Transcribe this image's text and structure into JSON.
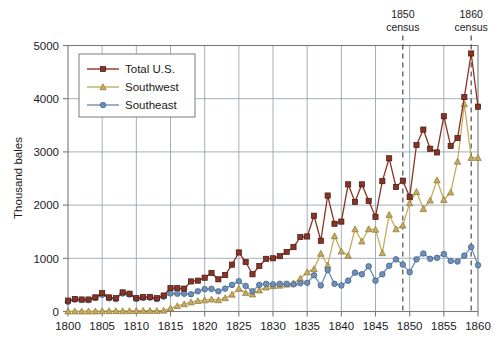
{
  "chart_data": {
    "type": "line",
    "title": "",
    "xlabel": "",
    "ylabel": "Thousand bales",
    "xlim": [
      1800,
      1860
    ],
    "ylim": [
      0,
      5000
    ],
    "xticks": [
      1800,
      1805,
      1810,
      1815,
      1820,
      1825,
      1830,
      1835,
      1840,
      1845,
      1850,
      1855,
      1860
    ],
    "yticks": [
      0,
      1000,
      2000,
      3000,
      4000,
      5000
    ],
    "grid": true,
    "legend_position": "upper-left",
    "x": [
      1800,
      1801,
      1802,
      1803,
      1804,
      1805,
      1806,
      1807,
      1808,
      1809,
      1810,
      1811,
      1812,
      1813,
      1814,
      1815,
      1816,
      1817,
      1818,
      1819,
      1820,
      1821,
      1822,
      1823,
      1824,
      1825,
      1826,
      1827,
      1828,
      1829,
      1830,
      1831,
      1832,
      1833,
      1834,
      1835,
      1836,
      1837,
      1838,
      1839,
      1840,
      1841,
      1842,
      1843,
      1844,
      1845,
      1846,
      1847,
      1848,
      1849,
      1850,
      1851,
      1852,
      1853,
      1854,
      1855,
      1856,
      1857,
      1858,
      1859,
      1860
    ],
    "series": [
      {
        "name": "Total U.S.",
        "color": "#8A3324",
        "marker": "square",
        "values": [
          205,
          235,
          225,
          225,
          265,
          345,
          265,
          250,
          360,
          335,
          250,
          270,
          275,
          250,
          300,
          440,
          440,
          430,
          565,
          580,
          635,
          725,
          605,
          685,
          880,
          1110,
          930,
          700,
          855,
          990,
          1000,
          1040,
          1120,
          1210,
          1400,
          1410,
          1800,
          1330,
          2180,
          1650,
          1690,
          2390,
          2060,
          2390,
          2080,
          1780,
          2450,
          2880,
          2340,
          2460,
          2150,
          3130,
          3420,
          3060,
          2990,
          3670,
          3110,
          3260,
          4030,
          4850,
          3850
        ]
      },
      {
        "name": "Southwest",
        "color": "#C6AB5E",
        "marker": "triangle",
        "values": [
          5,
          5,
          5,
          5,
          5,
          10,
          10,
          10,
          10,
          10,
          15,
          15,
          15,
          15,
          20,
          60,
          105,
          140,
          175,
          200,
          215,
          230,
          215,
          255,
          320,
          430,
          350,
          325,
          400,
          455,
          480,
          490,
          510,
          530,
          620,
          740,
          800,
          1090,
          870,
          1420,
          1130,
          1050,
          1550,
          1320,
          1550,
          1540,
          1100,
          1820,
          1550,
          1620,
          2040,
          2250,
          1930,
          2090,
          2470,
          2100,
          2240,
          2820,
          3900,
          2890,
          2890
        ]
      },
      {
        "name": "Southeast",
        "color": "#6E90B8",
        "marker": "circle",
        "values": [
          185,
          225,
          220,
          215,
          255,
          315,
          250,
          235,
          340,
          320,
          240,
          255,
          260,
          235,
          280,
          340,
          335,
          335,
          325,
          380,
          420,
          425,
          380,
          430,
          500,
          570,
          480,
          380,
          500,
          520,
          510,
          520,
          520,
          510,
          530,
          540,
          680,
          490,
          780,
          520,
          490,
          580,
          730,
          700,
          850,
          580,
          700,
          860,
          980,
          880,
          740,
          980,
          1090,
          990,
          1010,
          1080,
          950,
          940,
          1050,
          1210,
          870
        ]
      }
    ],
    "annotations": [
      {
        "name": "census-1850",
        "year_position": 1849,
        "line1": "1850",
        "line2": "census",
        "style": "dashed-vertical"
      },
      {
        "name": "census-1860",
        "year_position": 1859,
        "line1": "1860",
        "line2": "census",
        "style": "dashed-vertical"
      }
    ]
  },
  "legend": {
    "entries": [
      {
        "label": "Total U.S."
      },
      {
        "label": "Southwest"
      },
      {
        "label": "Southeast"
      }
    ]
  },
  "colors": {
    "total": "#8A3324",
    "southwest": "#C6AB5E",
    "southeast": "#6E90B8",
    "grid": "#9aa5b1",
    "frame": "#7a7a7a",
    "text": "#1a1a1a",
    "annotation_line": "#3c3c3c"
  }
}
